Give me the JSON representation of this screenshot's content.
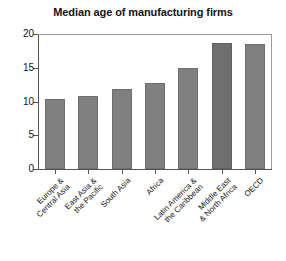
{
  "chart_data": {
    "type": "bar",
    "title": "Median age of manufacturing firms",
    "xlabel": "",
    "ylabel": "",
    "ylim": [
      0,
      20
    ],
    "yticks": [
      0,
      5,
      10,
      15,
      20
    ],
    "grid": false,
    "legend": "none",
    "categories": [
      "Europe & Central Asia",
      "East Asia & the Pacific",
      "South Asia",
      "Africa",
      "Latin America & the Caribbean",
      "Middle East & North Africa",
      "OECD"
    ],
    "category_lines": [
      [
        "Europe &",
        "Central Asia"
      ],
      [
        "East Asia &",
        "the Pacific"
      ],
      [
        "South Asia",
        ""
      ],
      [
        "Africa",
        ""
      ],
      [
        "Latin America &",
        "the Caribbean"
      ],
      [
        "Middle East",
        "& North Africa"
      ],
      [
        "OECD",
        ""
      ]
    ],
    "values": [
      10.4,
      10.8,
      11.9,
      12.8,
      14.9,
      18.7,
      18.5
    ],
    "bar_colors": [
      "#808080",
      "#808080",
      "#808080",
      "#808080",
      "#808080",
      "#6f6f6f",
      "#808080"
    ]
  },
  "axis": {
    "y_tick_labels": [
      "20",
      "15",
      "10",
      "5",
      "0"
    ]
  }
}
